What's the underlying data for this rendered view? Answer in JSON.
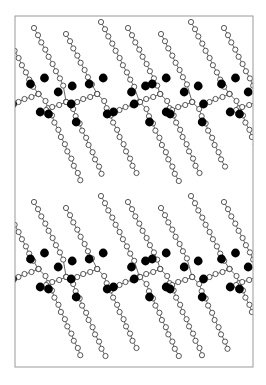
{
  "figure": {
    "frame": {
      "x": 15,
      "y": 16,
      "width": 238,
      "height": 351,
      "stroke": "#9a9a9a"
    },
    "colors": {
      "chain_atom_fill": "#ffffff",
      "chain_atom_stroke": "#444444",
      "bond": "#555555",
      "ion": "#000000"
    },
    "atom_radius": 2.6,
    "ion_radius": 4.4,
    "layers": [
      {
        "name": "upper-layer",
        "band_center_y": 100,
        "chain_top_y": 22,
        "chain_bottom_y": 185
      },
      {
        "name": "lower-layer",
        "band_center_y": 275,
        "chain_top_y": 196,
        "chain_bottom_y": 362
      }
    ],
    "column_start_x": [
      -6,
      28,
      60,
      95,
      122,
      155,
      185,
      218,
      250
    ],
    "column_spacing": 31,
    "chain_step": {
      "dx": 4.2,
      "dy": 7.2
    }
  }
}
